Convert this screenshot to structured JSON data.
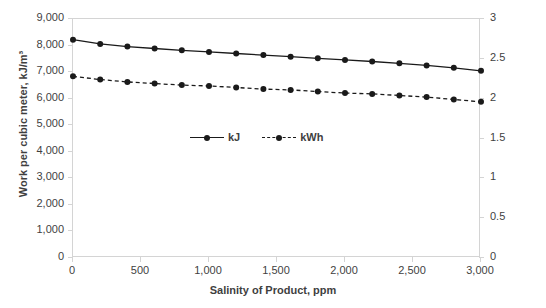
{
  "chart_data": {
    "type": "line",
    "title": "",
    "xlabel": "Salinity of Product, ppm",
    "ylabel": "Work per cubic meter, kJ/m³",
    "y2label": "Work per cubic meter, kWh/m³",
    "xlim": [
      0,
      3000
    ],
    "ylim": [
      0,
      9000
    ],
    "y2lim": [
      0,
      3
    ],
    "xticks": [
      0,
      500,
      1000,
      1500,
      2000,
      2500,
      3000
    ],
    "xticklabels": [
      "0",
      "500",
      "1,000",
      "1,500",
      "2,000",
      "2,500",
      "3,000"
    ],
    "yticks": [
      0,
      1000,
      2000,
      3000,
      4000,
      5000,
      6000,
      7000,
      8000,
      9000
    ],
    "yticklabels": [
      "0",
      "1,000",
      "2,000",
      "3,000",
      "4,000",
      "5,000",
      "6,000",
      "7,000",
      "8,000",
      "9,000"
    ],
    "y2ticks": [
      0,
      0.5,
      1,
      1.5,
      2,
      2.5,
      3
    ],
    "y2ticklabels": [
      "0",
      "0.5",
      "1",
      "1.5",
      "2",
      "2.5",
      "3"
    ],
    "grid": false,
    "legend_position": "center",
    "x": [
      0,
      200,
      400,
      600,
      800,
      1000,
      1200,
      1400,
      1600,
      1800,
      2000,
      2200,
      2400,
      2600,
      2800,
      3000
    ],
    "series": [
      {
        "name": "kJ",
        "axis": "left",
        "line_style": "solid",
        "marker": "circle",
        "color": "#1a1a1a",
        "values": [
          8220,
          8060,
          7960,
          7890,
          7820,
          7760,
          7700,
          7640,
          7580,
          7520,
          7460,
          7400,
          7330,
          7250,
          7160,
          7050
        ]
      },
      {
        "name": "kWh",
        "axis": "right",
        "line_style": "dashed",
        "marker": "circle",
        "color": "#1a1a1a",
        "values": [
          2.28,
          2.24,
          2.21,
          2.19,
          2.17,
          2.16,
          2.14,
          2.12,
          2.11,
          2.09,
          2.07,
          2.06,
          2.04,
          2.02,
          1.99,
          1.96
        ]
      }
    ],
    "legend": [
      {
        "label": "kJ",
        "line_style": "solid",
        "marker": "circle",
        "color": "#1a1a1a"
      },
      {
        "label": "kWh",
        "line_style": "dashed",
        "marker": "circle",
        "color": "#1a1a1a"
      }
    ]
  },
  "style": {
    "axis_color": "#d4d4d4",
    "text_color": "#3f3f3f",
    "plot_background": "#ffffff"
  }
}
